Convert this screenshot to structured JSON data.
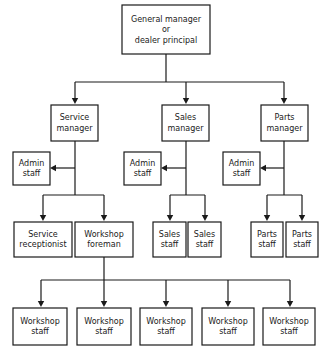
{
  "chart": {
    "type": "org-chart",
    "background_color": "#ffffff",
    "box_fill": "#ffffff",
    "line_color": "#1a1a1a",
    "text_color": "#1a1a1a"
  },
  "nodes": {
    "root": {
      "id": "general-manager",
      "lines": [
        "General manager",
        "or",
        "dealer principal"
      ],
      "x": 122,
      "y": 5,
      "w": 88,
      "h": 49
    },
    "managers": [
      {
        "id": "service-manager",
        "lines": [
          "Service",
          "manager"
        ],
        "x": 51,
        "y": 105,
        "w": 47,
        "h": 36
      },
      {
        "id": "sales-manager",
        "lines": [
          "Sales",
          "manager"
        ],
        "x": 162,
        "y": 105,
        "w": 47,
        "h": 36
      },
      {
        "id": "parts-manager",
        "lines": [
          "Parts",
          "manager"
        ],
        "x": 261,
        "y": 105,
        "w": 47,
        "h": 36
      }
    ],
    "admin_staff": [
      {
        "id": "admin-staff-service",
        "lines": [
          "Admin",
          "staff"
        ],
        "x": 13,
        "y": 152,
        "w": 37,
        "h": 33
      },
      {
        "id": "admin-staff-sales",
        "lines": [
          "Admin",
          "staff"
        ],
        "x": 124,
        "y": 152,
        "w": 37,
        "h": 33
      },
      {
        "id": "admin-staff-parts",
        "lines": [
          "Admin",
          "staff"
        ],
        "x": 223,
        "y": 152,
        "w": 37,
        "h": 33
      }
    ],
    "tier3": [
      {
        "id": "service-receptionist",
        "lines": [
          "Service",
          "receptionist"
        ],
        "x": 14,
        "y": 222,
        "w": 58,
        "h": 35
      },
      {
        "id": "workshop-foreman",
        "lines": [
          "Workshop",
          "foreman"
        ],
        "x": 75,
        "y": 222,
        "w": 58,
        "h": 35
      },
      {
        "id": "sales-staff-1",
        "lines": [
          "Sales",
          "staff"
        ],
        "x": 153,
        "y": 222,
        "w": 33,
        "h": 35
      },
      {
        "id": "sales-staff-2",
        "lines": [
          "Sales",
          "staff"
        ],
        "x": 188,
        "y": 222,
        "w": 33,
        "h": 35
      },
      {
        "id": "parts-staff-1",
        "lines": [
          "Parts",
          "staff"
        ],
        "x": 251,
        "y": 222,
        "w": 32,
        "h": 35
      },
      {
        "id": "parts-staff-2",
        "lines": [
          "Parts",
          "staff"
        ],
        "x": 286,
        "y": 222,
        "w": 32,
        "h": 35
      }
    ],
    "workshop_staff": [
      {
        "id": "workshop-staff-1",
        "lines": [
          "Workshop",
          "staff"
        ],
        "x": 13,
        "y": 308,
        "w": 54,
        "h": 37
      },
      {
        "id": "workshop-staff-2",
        "lines": [
          "Workshop",
          "staff"
        ],
        "x": 77,
        "y": 308,
        "w": 54,
        "h": 37
      },
      {
        "id": "workshop-staff-3",
        "lines": [
          "Workshop",
          "staff"
        ],
        "x": 140,
        "y": 308,
        "w": 52,
        "h": 37
      },
      {
        "id": "workshop-staff-4",
        "lines": [
          "Workshop",
          "staff"
        ],
        "x": 202,
        "y": 308,
        "w": 52,
        "h": 37
      },
      {
        "id": "workshop-staff-5",
        "lines": [
          "Workshop",
          "staff"
        ],
        "x": 263,
        "y": 308,
        "w": 52,
        "h": 37
      }
    ]
  },
  "connectors": {
    "root_drop": "M166,54 L166,82",
    "manager_bus": "M75,82 L284,82",
    "manager_drops": [
      "M75,82 L75,99",
      "M186,82 L186,99",
      "M284,82 L284,99"
    ],
    "service_spine": "M75,141 L75,195",
    "service_bus": "M43,195 L104,195",
    "service_drops": [
      "M43,195 L43,216",
      "M104,195 L104,216"
    ],
    "sales_spine": "M186,141 L186,195",
    "sales_bus": "M170,195 L205,195",
    "sales_drops": [
      "M170,195 L170,216",
      "M205,195 L205,216"
    ],
    "parts_spine": "M284,141 L284,195",
    "parts_bus": "M267,195 L302,195",
    "parts_drops": [
      "M267,195 L267,216",
      "M302,195 L302,216"
    ],
    "admin_arrows": [
      {
        "from_x": 75,
        "to_x": 50,
        "y": 168
      },
      {
        "from_x": 186,
        "to_x": 161,
        "y": 168
      },
      {
        "from_x": 284,
        "to_x": 260,
        "y": 168
      }
    ],
    "foreman_spine": "M104,257 L104,280",
    "workshop_bus": "M41,280 L290,280",
    "workshop_drops": [
      "M41,280 L41,302",
      "M104,280 L104,302",
      "M166,280 L166,302",
      "M228,280 L228,302",
      "M290,280 L290,302"
    ]
  }
}
